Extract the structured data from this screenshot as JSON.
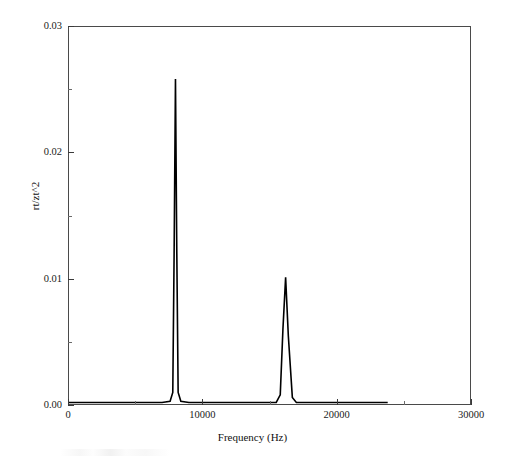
{
  "chart_data": {
    "type": "line",
    "title": "",
    "xlabel": "Frequency (Hz)",
    "ylabel": "rt/zt^2",
    "xlim": [
      0,
      30000
    ],
    "ylim": [
      0,
      0.03
    ],
    "grid": false,
    "legend": null,
    "xticks": [
      0,
      10000,
      20000,
      30000
    ],
    "xtick_labels": [
      "0",
      "10000",
      "20000",
      "30000"
    ],
    "xminor_ticks": [
      5000,
      15000,
      25000
    ],
    "yticks": [
      0.0,
      0.01,
      0.02,
      0.03
    ],
    "ytick_labels": [
      "0.00",
      "0.01",
      "0.02",
      "0.03"
    ],
    "yminor_ticks": [
      0.005,
      0.015,
      0.025
    ],
    "series": [
      {
        "name": "spectrum",
        "color": "#000000",
        "x": [
          0,
          1000,
          2000,
          3000,
          4000,
          5000,
          6000,
          7000,
          7600,
          7800,
          7900,
          8000,
          8100,
          8200,
          8400,
          9000,
          10000,
          11000,
          12000,
          13000,
          14000,
          15000,
          15500,
          15800,
          16000,
          16200,
          16400,
          16700,
          17000,
          17500,
          18000,
          19000,
          20000,
          21000,
          22000,
          23000,
          23800
        ],
        "y": [
          0.0002,
          0.0002,
          0.0002,
          0.0002,
          0.0002,
          0.0002,
          0.0002,
          0.0002,
          0.0003,
          0.001,
          0.012,
          0.0258,
          0.012,
          0.001,
          0.0003,
          0.0002,
          0.0002,
          0.0002,
          0.0002,
          0.0002,
          0.0002,
          0.0002,
          0.0002,
          0.0008,
          0.006,
          0.0101,
          0.0055,
          0.0006,
          0.0002,
          0.0002,
          0.0002,
          0.0002,
          0.0002,
          0.0002,
          0.0002,
          0.0002,
          0.0002
        ]
      }
    ],
    "peaks": [
      {
        "label": "fundamental",
        "frequency": 8040,
        "amplitude": 0.0258
      },
      {
        "label": "second-harmonic",
        "frequency": 16170,
        "amplitude": 0.0101
      }
    ],
    "data_extent_hz": 23800
  },
  "axes": {
    "x_title": "Frequency (Hz)",
    "y_title": "rt/zt^2"
  },
  "ticks": {
    "x": [
      {
        "value": 0,
        "label": "0"
      },
      {
        "value": 10000,
        "label": "10000"
      },
      {
        "value": 20000,
        "label": "20000"
      },
      {
        "value": 30000,
        "label": "30000"
      }
    ],
    "y": [
      {
        "value": 0,
        "label": "0.00"
      },
      {
        "value": 0.01,
        "label": "0.01"
      },
      {
        "value": 0.02,
        "label": "0.02"
      },
      {
        "value": 0.03,
        "label": "0.03"
      }
    ]
  },
  "style": {
    "line_color": "#000000",
    "frame_color": "#4a4a4a",
    "text_color": "#1a1a1a",
    "background": "#ffffff"
  }
}
